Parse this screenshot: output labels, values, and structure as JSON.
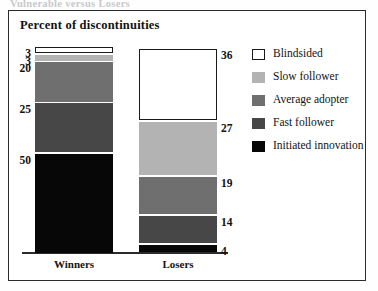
{
  "top_caption": "Vulnerable versus Losers",
  "frame": {
    "border_color": "#2b2b2b"
  },
  "chart_data": {
    "type": "bar",
    "subtype": "stacked-column",
    "title": "Percent of discontinuities",
    "xlabel": "",
    "ylabel": "",
    "ylim": [
      0,
      101
    ],
    "grid": false,
    "legend_position": "right",
    "categories": [
      "Winners",
      "Losers"
    ],
    "series": [
      {
        "name": "Blindsided",
        "color": "#ffffff",
        "outlined": true,
        "values": [
          3,
          36
        ]
      },
      {
        "name": "Slow follower",
        "color": "#b3b3b3",
        "outlined": false,
        "values": [
          3,
          27
        ]
      },
      {
        "name": "Average adopter",
        "color": "#6f6f6f",
        "outlined": false,
        "values": [
          20,
          19
        ]
      },
      {
        "name": "Fast follower",
        "color": "#474747",
        "outlined": false,
        "values": [
          25,
          14
        ]
      },
      {
        "name": "Initiated innovation",
        "color": "#070707",
        "outlined": false,
        "values": [
          50,
          4
        ]
      }
    ],
    "data_labels": {
      "winners": [
        "3",
        "3",
        "20",
        "25",
        "50"
      ],
      "losers": [
        "36",
        "27",
        "19",
        "14",
        "4"
      ]
    }
  }
}
